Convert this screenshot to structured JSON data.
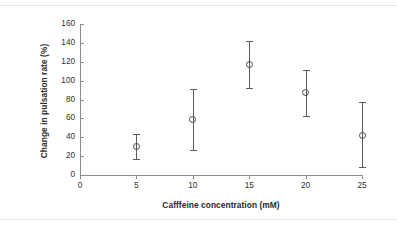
{
  "chart_data": {
    "type": "scatter",
    "title": "",
    "xlabel": "Cafffeine concentration (mM)",
    "ylabel": "Change in pulsation rate (%)",
    "xlim": [
      0,
      25
    ],
    "ylim": [
      0,
      160
    ],
    "grid": false,
    "legend": false,
    "marker_style": "open-circle",
    "error_bars": "symmetric",
    "x_ticks": [
      "0",
      "5",
      "10",
      "15",
      "20",
      "25"
    ],
    "y_ticks": [
      "0",
      "20",
      "40",
      "60",
      "80",
      "100",
      "120",
      "140",
      "160"
    ],
    "x": [
      5,
      10,
      15,
      20,
      25
    ],
    "values": [
      30,
      59,
      117,
      87,
      42
    ],
    "errors": [
      13,
      32,
      25,
      24,
      33
    ],
    "points": [
      {
        "x": 5,
        "y": 30,
        "err": 13,
        "low": 17,
        "high": 43
      },
      {
        "x": 10,
        "y": 59,
        "err": 32,
        "low": 26,
        "high": 91
      },
      {
        "x": 15,
        "y": 117,
        "err": 25,
        "low": 92,
        "high": 142
      },
      {
        "x": 20,
        "y": 87,
        "err": 24,
        "low": 63,
        "high": 111
      },
      {
        "x": 25,
        "y": 42,
        "err": 33,
        "low": 9,
        "high": 77
      }
    ]
  },
  "colors": {
    "axis": "#8c8c8c",
    "marker_outline": "#4a4a4a",
    "error_bar": "#5a5a5a",
    "text": "#2f2f2f",
    "background": "#ffffff",
    "scan_rule": "#e3e5e8"
  }
}
